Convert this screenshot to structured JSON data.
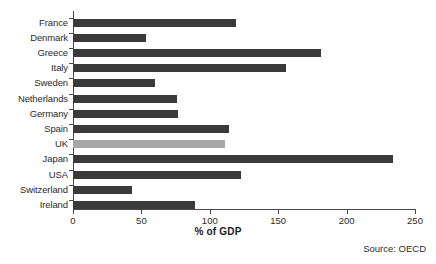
{
  "chart_data": {
    "type": "bar",
    "orientation": "horizontal",
    "title": "",
    "xlabel": "% of GDP",
    "ylabel": "",
    "xlim": [
      0,
      250
    ],
    "xticks": [
      0,
      50,
      100,
      150,
      200,
      250
    ],
    "grid": false,
    "legend": null,
    "categories": [
      "France",
      "Denmark",
      "Greece",
      "Italy",
      "Sweden",
      "Netherlands",
      "Germany",
      "Spain",
      "UK",
      "Japan",
      "USA",
      "Switzerland",
      "Ireland"
    ],
    "values": [
      119,
      53,
      181,
      156,
      60,
      76,
      77,
      114,
      111,
      234,
      123,
      43,
      89
    ],
    "highlight_category": "UK",
    "bar_color": "#3a3a3a",
    "highlight_color": "#a6a6a6",
    "annotation": "Source: OECD"
  }
}
